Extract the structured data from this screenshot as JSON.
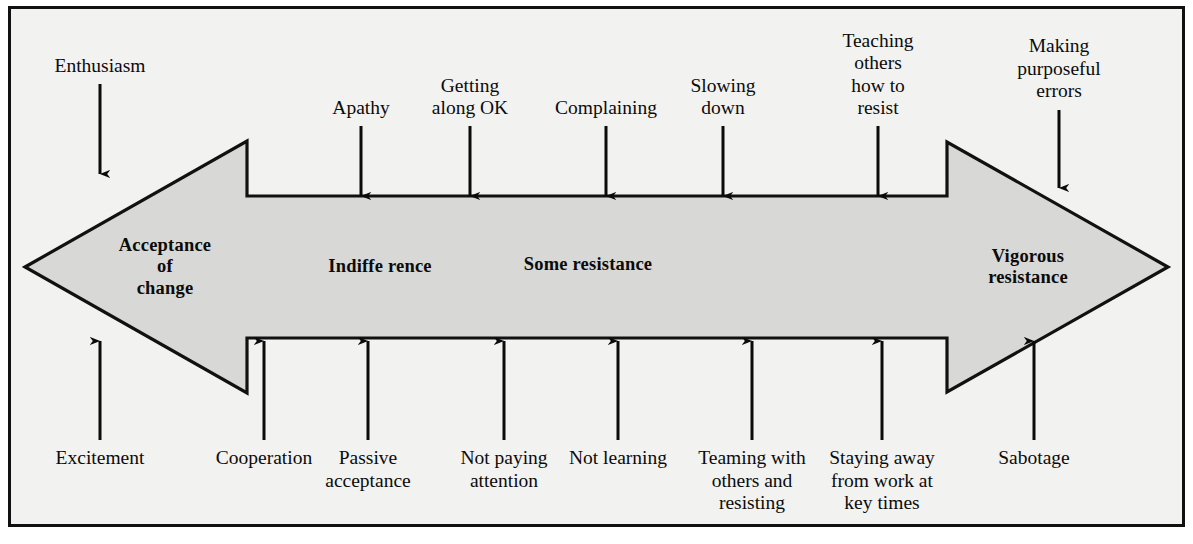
{
  "figure": {
    "width": 1193,
    "height": 544,
    "background_color": "#f2f2f0",
    "frame_color": "#111111",
    "arrow_fill_color": "#d8d8d6",
    "arrow_stroke_color": "#111111",
    "annotation_color": "#0b0b0b"
  },
  "arrow": {
    "description": "double-headed horizontal arrow spanning the full figure",
    "left_head_label": "Acceptance of change",
    "right_head_label": "Vigorous resistance",
    "band_labels": [
      {
        "id": "acceptance-of-change",
        "text": "Acceptance\nof\nchange",
        "x": 165,
        "y": 267
      },
      {
        "id": "indifference",
        "text": "Indiffe rence",
        "x": 380,
        "y": 267
      },
      {
        "id": "some-resistance",
        "text": "Some resistance",
        "x": 588,
        "y": 265
      },
      {
        "id": "vigorous-resistance",
        "text": "Vigorous\nresistance",
        "x": 1028,
        "y": 267
      }
    ]
  },
  "top_annotations": [
    {
      "id": "enthusiasm",
      "text": "Enthusiasm",
      "x": 100,
      "label_bottom_y": 78,
      "arrow_from_y": 84,
      "arrow_to_y": 174
    },
    {
      "id": "apathy",
      "text": "Apathy",
      "x": 361,
      "label_bottom_y": 120,
      "arrow_from_y": 126,
      "arrow_to_y": 196
    },
    {
      "id": "getting-along-ok",
      "text": "Getting\nalong OK",
      "x": 470,
      "label_bottom_y": 120,
      "arrow_from_y": 126,
      "arrow_to_y": 196
    },
    {
      "id": "complaining",
      "text": "Complaining",
      "x": 606,
      "label_bottom_y": 120,
      "arrow_from_y": 126,
      "arrow_to_y": 196
    },
    {
      "id": "slowing-down",
      "text": "Slowing\ndown",
      "x": 723,
      "label_bottom_y": 120,
      "arrow_from_y": 126,
      "arrow_to_y": 196
    },
    {
      "id": "teaching-others-how-to-resist",
      "text": "Teaching\nothers\nhow to\nresist",
      "x": 878,
      "label_bottom_y": 120,
      "arrow_from_y": 126,
      "arrow_to_y": 196
    },
    {
      "id": "making-purposeful-errors",
      "text": "Making\npurposeful\nerrors",
      "x": 1059,
      "label_bottom_y": 103,
      "arrow_from_y": 110,
      "arrow_to_y": 188
    }
  ],
  "bottom_annotations": [
    {
      "id": "excitement",
      "text": "Excitement",
      "x": 100,
      "label_top_y": 447,
      "arrow_from_y": 440,
      "arrow_to_y": 341
    },
    {
      "id": "cooperation",
      "text": "Cooperation",
      "x": 264,
      "label_top_y": 447,
      "arrow_from_y": 440,
      "arrow_to_y": 341
    },
    {
      "id": "passive-acceptance",
      "text": "Passive\nacceptance",
      "x": 368,
      "label_top_y": 447,
      "arrow_from_y": 440,
      "arrow_to_y": 341
    },
    {
      "id": "not-paying-attention",
      "text": "Not paying\nattention",
      "x": 504,
      "label_top_y": 447,
      "arrow_from_y": 440,
      "arrow_to_y": 341
    },
    {
      "id": "not-learning",
      "text": "Not learning",
      "x": 618,
      "label_top_y": 447,
      "arrow_from_y": 440,
      "arrow_to_y": 341
    },
    {
      "id": "teaming-with-others-and-resisting",
      "text": "Teaming with\nothers and\nresisting",
      "x": 752,
      "label_top_y": 447,
      "arrow_from_y": 440,
      "arrow_to_y": 341
    },
    {
      "id": "staying-away-from-work-at-key-times",
      "text": "Staying away\nfrom work at\nkey times",
      "x": 882,
      "label_top_y": 447,
      "arrow_from_y": 440,
      "arrow_to_y": 341
    },
    {
      "id": "sabotage",
      "text": "Sabotage",
      "x": 1034,
      "label_top_y": 447,
      "arrow_from_y": 440,
      "arrow_to_y": 341
    }
  ]
}
